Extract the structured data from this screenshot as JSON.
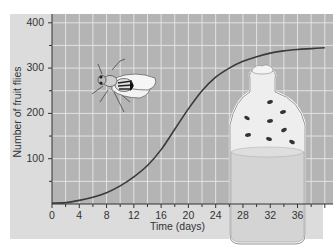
{
  "chart_data": {
    "type": "line",
    "title": "",
    "xlabel": "Time (days)",
    "ylabel": "Number of fruit flies",
    "xlim": [
      0,
      40
    ],
    "ylim": [
      0,
      410
    ],
    "x_ticks": [
      0,
      4,
      8,
      12,
      16,
      20,
      24,
      28,
      32,
      36
    ],
    "y_ticks": [
      100,
      200,
      300,
      400
    ],
    "grid": true,
    "legend": null,
    "series": [
      {
        "name": "Fruit fly population",
        "x": [
          0,
          2,
          4,
          6,
          8,
          10,
          12,
          14,
          16,
          18,
          20,
          22,
          24,
          26,
          28,
          30,
          32,
          34,
          36,
          38,
          40
        ],
        "values": [
          2,
          3,
          8,
          15,
          25,
          40,
          60,
          85,
          120,
          165,
          210,
          250,
          280,
          300,
          315,
          325,
          333,
          338,
          341,
          343,
          345
        ]
      }
    ],
    "annotations": [
      "fruit fly illustration",
      "bottle with fruit flies and culture medium"
    ]
  },
  "axes": {
    "xlabel": "Time (days)",
    "ylabel": "Number of fruit flies",
    "x_tick_labels": [
      "0",
      "4",
      "8",
      "12",
      "16",
      "20",
      "24",
      "28",
      "32",
      "36"
    ],
    "y_tick_labels": [
      "100",
      "200",
      "300",
      "400"
    ]
  },
  "colors": {
    "panel_bg": "#dcdcdc",
    "plot_bg": "#b4b4b4",
    "grid": "#e8e8e8",
    "curve": "#3a3a3a",
    "axis": "#333333"
  }
}
